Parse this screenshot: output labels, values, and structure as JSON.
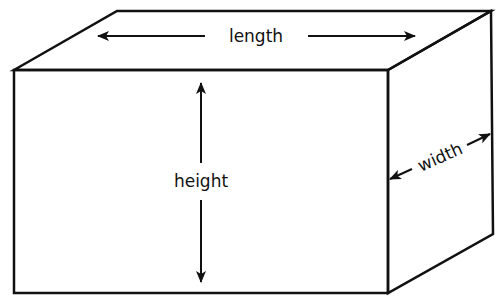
{
  "diagram": {
    "type": "rectangular-prism-dimensions",
    "labels": {
      "length": "length",
      "height": "height",
      "width": "width"
    },
    "colors": {
      "stroke": "#111111",
      "background": "#ffffff"
    }
  }
}
